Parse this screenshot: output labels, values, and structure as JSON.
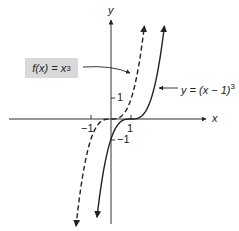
{
  "figure": {
    "axes": {
      "x_label": "x",
      "y_label": "y",
      "x_ticks": [
        {
          "value": -1,
          "label": "−1"
        },
        {
          "value": 1,
          "label": "1"
        }
      ],
      "y_ticks": [
        {
          "value": 1,
          "label": "1"
        },
        {
          "value": -1,
          "label": "−1"
        }
      ]
    },
    "curves": [
      {
        "name": "f(x) = x^3",
        "style": "dashed",
        "equation": "x^3"
      },
      {
        "name": "y = (x − 1)^3",
        "style": "solid",
        "equation": "(x-1)^3"
      }
    ],
    "labels": {
      "f_label_prefix": "f(x) = x",
      "f_label_exp": "3",
      "g_label_prefix": "y = (x − 1)",
      "g_label_exp": "3"
    },
    "colors": {
      "line": "#222222",
      "label_box": "#d9d9d9",
      "background": "#ffffff"
    }
  }
}
